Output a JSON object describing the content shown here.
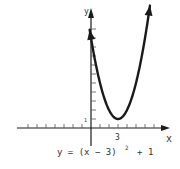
{
  "chart_data": {
    "type": "line",
    "title": "",
    "equation_label": "y = (x − 3)² + 1",
    "equation_parts": {
      "lhs": "y = (x − 3)",
      "exponent": "2",
      "rhs": "+ 1"
    },
    "xlabel": "x",
    "ylabel": "y",
    "x_tick_labels": [
      {
        "value": 3,
        "label": "3"
      }
    ],
    "y_tick_labels": [
      {
        "value": 1,
        "label": "1"
      }
    ],
    "xlim": [
      -8,
      9
    ],
    "ylim": [
      -2,
      12
    ],
    "grid": false,
    "series": [
      {
        "name": "y = (x - 3)^2 + 1",
        "x": [
          -0.1,
          0,
          1,
          2,
          3,
          4,
          5,
          6,
          6.5
        ],
        "y": [
          10.6,
          10,
          5,
          2,
          1,
          2,
          5,
          10,
          13.25
        ]
      }
    ],
    "vertex": {
      "x": 3,
      "y": 1
    },
    "arrows_on_curve_ends": true
  },
  "colors": {
    "ink": "#1a1a1a",
    "tick": "#555555",
    "background": "#ffffff"
  }
}
